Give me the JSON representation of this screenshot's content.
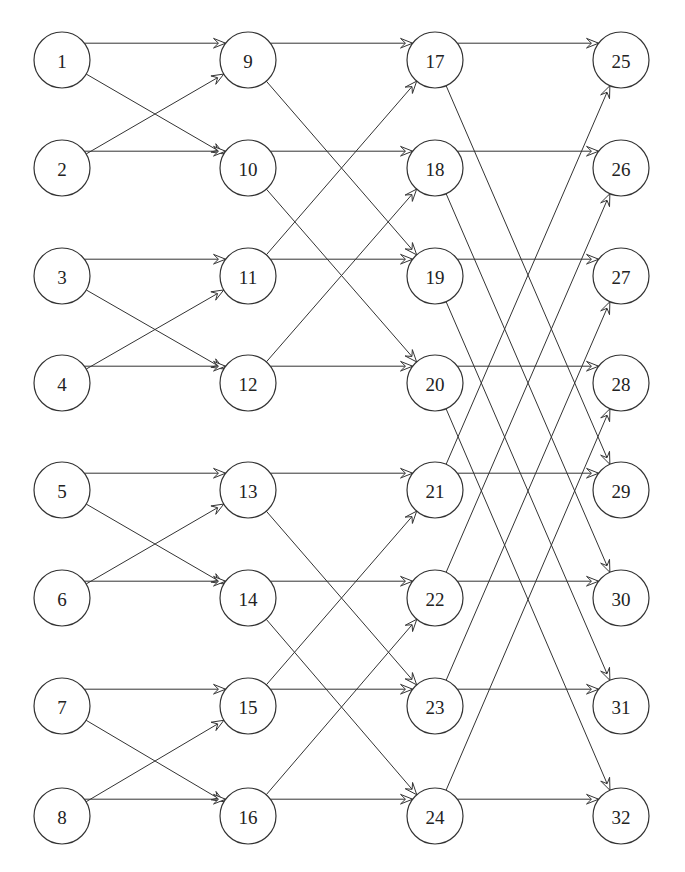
{
  "diagram": {
    "type": "butterfly-network",
    "node_radius": 28,
    "columns": [
      {
        "x": 62,
        "nodes": [
          1,
          2,
          3,
          4,
          5,
          6,
          7,
          8
        ]
      },
      {
        "x": 248,
        "nodes": [
          9,
          10,
          11,
          12,
          13,
          14,
          15,
          16
        ]
      },
      {
        "x": 435,
        "nodes": [
          17,
          18,
          19,
          20,
          21,
          22,
          23,
          24
        ]
      },
      {
        "x": 621,
        "nodes": [
          25,
          26,
          27,
          28,
          29,
          30,
          31,
          32
        ]
      }
    ],
    "row_y": [
      60,
      168,
      276,
      383,
      490,
      598,
      706,
      816
    ],
    "edges": [
      [
        1,
        9
      ],
      [
        1,
        10
      ],
      [
        2,
        9
      ],
      [
        2,
        10
      ],
      [
        3,
        11
      ],
      [
        3,
        12
      ],
      [
        4,
        11
      ],
      [
        4,
        12
      ],
      [
        5,
        13
      ],
      [
        5,
        14
      ],
      [
        6,
        13
      ],
      [
        6,
        14
      ],
      [
        7,
        15
      ],
      [
        7,
        16
      ],
      [
        8,
        15
      ],
      [
        8,
        16
      ],
      [
        9,
        17
      ],
      [
        9,
        19
      ],
      [
        10,
        18
      ],
      [
        10,
        20
      ],
      [
        11,
        17
      ],
      [
        11,
        19
      ],
      [
        12,
        18
      ],
      [
        12,
        20
      ],
      [
        13,
        21
      ],
      [
        13,
        23
      ],
      [
        14,
        22
      ],
      [
        14,
        24
      ],
      [
        15,
        21
      ],
      [
        15,
        23
      ],
      [
        16,
        22
      ],
      [
        16,
        24
      ],
      [
        17,
        25
      ],
      [
        17,
        29
      ],
      [
        18,
        26
      ],
      [
        18,
        30
      ],
      [
        19,
        27
      ],
      [
        19,
        31
      ],
      [
        20,
        28
      ],
      [
        20,
        32
      ],
      [
        21,
        25
      ],
      [
        21,
        29
      ],
      [
        22,
        26
      ],
      [
        22,
        30
      ],
      [
        23,
        27
      ],
      [
        23,
        31
      ],
      [
        24,
        28
      ],
      [
        24,
        32
      ]
    ]
  }
}
